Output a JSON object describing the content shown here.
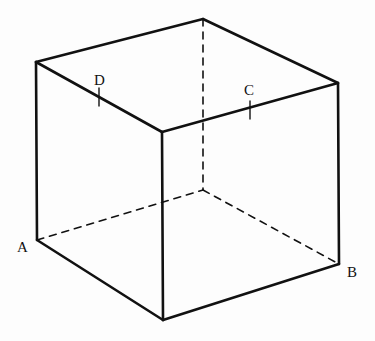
{
  "figure": {
    "background_color": "#fdfdfd",
    "stroke_color": "#111111",
    "solid_stroke_width": 2.6,
    "hidden_stroke_width": 1.6,
    "hidden_dash_pattern": "7,6",
    "tick_stroke_width": 1.4
  },
  "vertices": {
    "top_back": {
      "x": 203,
      "y": 19,
      "name": "top-back-vertex"
    },
    "top_left": {
      "x": 36,
      "y": 62,
      "name": "top-left-vertex"
    },
    "top_right": {
      "x": 338,
      "y": 83,
      "name": "top-right-vertex"
    },
    "top_front": {
      "x": 162,
      "y": 132,
      "name": "top-front-vertex"
    },
    "bottom_left": {
      "x": 37,
      "y": 240,
      "name": "bottom-left-vertex-A"
    },
    "bottom_right": {
      "x": 339,
      "y": 264,
      "name": "bottom-right-vertex-B"
    },
    "bottom_front": {
      "x": 163,
      "y": 320,
      "name": "bottom-front-vertex"
    },
    "bottom_back": {
      "x": 203,
      "y": 190,
      "name": "bottom-back-vertex-hidden"
    }
  },
  "edges": {
    "solid": [
      {
        "name": "top-left-to-top-back",
        "from": "top_left",
        "to": "top_back"
      },
      {
        "name": "top-back-to-top-right",
        "from": "top_back",
        "to": "top_right"
      },
      {
        "name": "top-left-to-top-front",
        "from": "top_left",
        "to": "top_front"
      },
      {
        "name": "top-front-to-top-right",
        "from": "top_front",
        "to": "top_right"
      },
      {
        "name": "left-vertical-edge",
        "from": "top_left",
        "to": "bottom_left"
      },
      {
        "name": "front-vertical-edge",
        "from": "top_front",
        "to": "bottom_front"
      },
      {
        "name": "right-vertical-edge",
        "from": "top_right",
        "to": "bottom_right"
      },
      {
        "name": "bottom-left-to-bottom-front",
        "from": "bottom_left",
        "to": "bottom_front"
      },
      {
        "name": "bottom-front-to-bottom-right",
        "from": "bottom_front",
        "to": "bottom_right"
      }
    ],
    "hidden": [
      {
        "name": "hidden-vertical-edge",
        "from": "top_back",
        "to": "bottom_back"
      },
      {
        "name": "hidden-bottom-left-edge",
        "from": "bottom_left",
        "to": "bottom_back"
      },
      {
        "name": "hidden-bottom-right-edge",
        "from": "bottom_back",
        "to": "bottom_right"
      }
    ]
  },
  "labels": [
    {
      "id": "A",
      "text": "A",
      "x": 17,
      "y": 252,
      "anchor": "start",
      "name": "vertex-label-a"
    },
    {
      "id": "B",
      "text": "B",
      "x": 347,
      "y": 277,
      "anchor": "start",
      "name": "vertex-label-b"
    },
    {
      "id": "C",
      "text": "C",
      "x": 244,
      "y": 95,
      "anchor": "start",
      "name": "point-label-c"
    },
    {
      "id": "D",
      "text": "D",
      "x": 94,
      "y": 85,
      "anchor": "start",
      "name": "point-label-d"
    }
  ],
  "tick_marks": [
    {
      "id": "D",
      "x1": 99,
      "y1": 88,
      "x2": 99,
      "y2": 106,
      "name": "tick-mark-d"
    },
    {
      "id": "C",
      "x1": 250,
      "y1": 101,
      "x2": 250,
      "y2": 119,
      "name": "tick-mark-c"
    }
  ]
}
